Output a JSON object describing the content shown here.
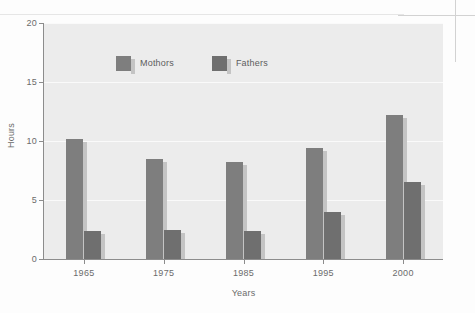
{
  "chart_data": {
    "type": "bar",
    "title": "",
    "subtitle": "",
    "xlabel": "Years",
    "ylabel": "Hours",
    "categories": [
      "1965",
      "1975",
      "1985",
      "1995",
      "2000"
    ],
    "series": [
      {
        "name": "Mothors",
        "values": [
          10.2,
          8.5,
          8.2,
          9.4,
          12.2
        ],
        "color": "#7e7e7e"
      },
      {
        "name": "Fathers",
        "values": [
          2.4,
          2.5,
          2.4,
          4.0,
          6.5
        ],
        "color": "#6f6f6f"
      }
    ],
    "ylim": [
      0,
      20
    ],
    "ytick_labels": [
      "0",
      "5",
      "10",
      "15",
      "20"
    ],
    "ytick_values": [
      0,
      5,
      10,
      15,
      20
    ],
    "grid": true,
    "grid_axis": "y",
    "legend_position": "top-left-inside",
    "plot_background": "#ececec",
    "page_background": "#fdfdfd",
    "axis_color": "#8c8c8c",
    "gridline_color": "#fafafa",
    "text_color": "#6b6b6b"
  },
  "legend": {
    "entries": [
      {
        "label": "Mothors"
      },
      {
        "label": "Fathers"
      }
    ]
  },
  "axes": {
    "y_title": "Hours",
    "x_title": "Years"
  }
}
